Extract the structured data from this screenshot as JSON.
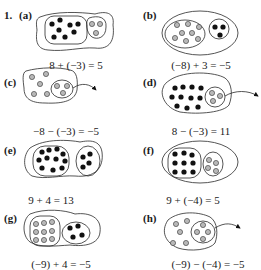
{
  "problem_number": "1.",
  "colors": {
    "positive": "#111111",
    "negative": "#b8b8b8",
    "outline": "#2a2a2a"
  },
  "panels": [
    {
      "label": "(a)",
      "equation": "8 + (−3) = 5",
      "positives": 8,
      "negatives": 3,
      "operation": "add"
    },
    {
      "label": "(b)",
      "equation": "(−8) + 3 = −5",
      "positives": 3,
      "negatives": 8,
      "operation": "add"
    },
    {
      "label": "(c)",
      "equation": "−8 − (−3) = −5",
      "positives": 0,
      "negatives": 8,
      "operation": "subtract",
      "removed": 3
    },
    {
      "label": "(d)",
      "equation": "8 − (−3) = 11",
      "positives": 11,
      "negatives": 3,
      "operation": "subtract",
      "removed": 3
    },
    {
      "label": "(e)",
      "equation": "9 + 4 = 13",
      "positives": 13,
      "negatives": 0,
      "operation": "add"
    },
    {
      "label": "(f)",
      "equation": "9 + (−4) = 5",
      "positives": 9,
      "negatives": 4,
      "operation": "add"
    },
    {
      "label": "(g)",
      "equation": "(−9) + 4 = −5",
      "positives": 4,
      "negatives": 9,
      "operation": "add"
    },
    {
      "label": "(h)",
      "equation": "(−9) − (−4) = −5",
      "positives": 0,
      "negatives": 9,
      "operation": "subtract",
      "removed": 4
    }
  ]
}
